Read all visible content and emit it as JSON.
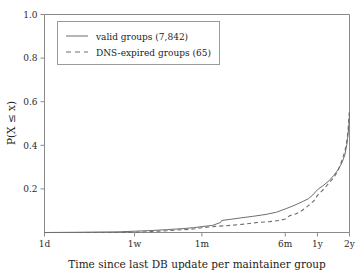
{
  "chart_data": {
    "type": "line",
    "title": "",
    "xlabel": "Time since last DB update per maintainer group",
    "ylabel": "P(X ≤ x)",
    "xscale": "log-time",
    "ylim": [
      0.0,
      1.0
    ],
    "grid": false,
    "legend_position": "upper left",
    "y_ticks": [
      "0.2",
      "0.4",
      "0.6",
      "0.8",
      "1.0"
    ],
    "y_tick_values": [
      0.2,
      0.4,
      0.6,
      0.8,
      1.0
    ],
    "x_ticks": [
      "1d",
      "1w",
      "1m",
      "6m",
      "1y",
      "2y"
    ],
    "x_tick_days": [
      1,
      7,
      30,
      182,
      365,
      730
    ],
    "series": [
      {
        "name": "valid groups (7,842)",
        "style": "solid",
        "color": "#6e6e6e",
        "points": [
          [
            1,
            0.0
          ],
          [
            2,
            0.001
          ],
          [
            3,
            0.002
          ],
          [
            5,
            0.003
          ],
          [
            7,
            0.006
          ],
          [
            10,
            0.009
          ],
          [
            14,
            0.013
          ],
          [
            20,
            0.018
          ],
          [
            25,
            0.022
          ],
          [
            30,
            0.027
          ],
          [
            38,
            0.033
          ],
          [
            45,
            0.046
          ],
          [
            46,
            0.055
          ],
          [
            55,
            0.06
          ],
          [
            70,
            0.067
          ],
          [
            90,
            0.074
          ],
          [
            120,
            0.083
          ],
          [
            150,
            0.093
          ],
          [
            182,
            0.108
          ],
          [
            220,
            0.124
          ],
          [
            260,
            0.14
          ],
          [
            300,
            0.155
          ],
          [
            330,
            0.172
          ],
          [
            365,
            0.196
          ],
          [
            420,
            0.218
          ],
          [
            470,
            0.238
          ],
          [
            520,
            0.262
          ],
          [
            570,
            0.288
          ],
          [
            620,
            0.32
          ],
          [
            660,
            0.356
          ],
          [
            690,
            0.404
          ],
          [
            700,
            0.43
          ],
          [
            710,
            0.455
          ],
          [
            720,
            0.49
          ],
          [
            728,
            0.53
          ],
          [
            730,
            0.548
          ]
        ]
      },
      {
        "name": "DNS-expired groups (65)",
        "style": "dashed",
        "color": "#6e6e6e",
        "points": [
          [
            1,
            0.0
          ],
          [
            4,
            0.0
          ],
          [
            7,
            0.001
          ],
          [
            10,
            0.004
          ],
          [
            14,
            0.008
          ],
          [
            20,
            0.013
          ],
          [
            25,
            0.016
          ],
          [
            30,
            0.022
          ],
          [
            40,
            0.028
          ],
          [
            50,
            0.031
          ],
          [
            60,
            0.034
          ],
          [
            80,
            0.04
          ],
          [
            100,
            0.046
          ],
          [
            130,
            0.05
          ],
          [
            160,
            0.055
          ],
          [
            182,
            0.062
          ],
          [
            200,
            0.077
          ],
          [
            230,
            0.086
          ],
          [
            260,
            0.1
          ],
          [
            300,
            0.123
          ],
          [
            340,
            0.146
          ],
          [
            365,
            0.17
          ],
          [
            420,
            0.2
          ],
          [
            470,
            0.228
          ],
          [
            520,
            0.252
          ],
          [
            570,
            0.285
          ],
          [
            620,
            0.33
          ],
          [
            660,
            0.372
          ],
          [
            690,
            0.42
          ],
          [
            705,
            0.462
          ],
          [
            715,
            0.5
          ],
          [
            725,
            0.545
          ],
          [
            730,
            0.56
          ]
        ]
      }
    ]
  },
  "legend": {
    "entries": [
      {
        "label": "valid groups (7,842)",
        "style": "solid"
      },
      {
        "label": "DNS-expired groups (65)",
        "style": "dashed"
      }
    ]
  }
}
